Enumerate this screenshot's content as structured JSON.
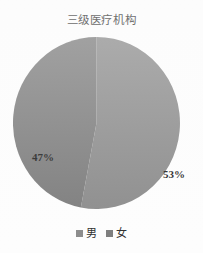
{
  "chart_data": {
    "type": "pie",
    "title": "三级医疗机构",
    "categories": [
      "男",
      "女"
    ],
    "values": [
      53,
      47
    ],
    "labels": [
      "53%",
      "47%"
    ],
    "unit": "%",
    "start_angle_deg": 0,
    "direction": "clockwise",
    "legend_position": "bottom",
    "grid": false,
    "slices": [
      {
        "name": "男",
        "value": 53,
        "label": "53%",
        "color": "#8a8a8a",
        "side": "right"
      },
      {
        "name": "女",
        "value": 47,
        "label": "47%",
        "color": "#7b7b7b",
        "side": "left"
      }
    ]
  },
  "title": {
    "text": "三级医疗机构"
  },
  "pie": {
    "male_label": "53%",
    "female_label": "47%",
    "male_color": "#8a8a8a",
    "female_color": "#7b7b7b",
    "background_color": "#fdfdfd"
  },
  "legend": {
    "items": [
      {
        "label": "男",
        "color": "#8a8a8a"
      },
      {
        "label": "女",
        "color": "#7b7b7b"
      }
    ]
  }
}
